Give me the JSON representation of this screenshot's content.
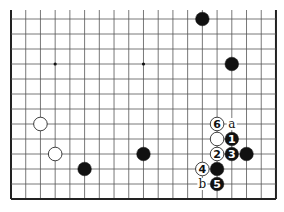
{
  "board": {
    "origin_x": 11,
    "origin_y": 19,
    "spacing_x": 14.72,
    "spacing_y": 15,
    "cols": 19,
    "rows": 13,
    "top_open_to_y": 10,
    "line_color": "#555555",
    "edge_color": "#222222",
    "star_points": [
      [
        3,
        3
      ],
      [
        9,
        3
      ]
    ]
  },
  "stones": [
    {
      "color": "black",
      "col": 13,
      "row": 0,
      "label": ""
    },
    {
      "color": "black",
      "col": 15,
      "row": 3,
      "label": ""
    },
    {
      "color": "white",
      "col": 2,
      "row": 7,
      "label": ""
    },
    {
      "color": "white",
      "col": 3,
      "row": 9,
      "label": ""
    },
    {
      "color": "black",
      "col": 5,
      "row": 10,
      "label": ""
    },
    {
      "color": "black",
      "col": 9,
      "row": 9,
      "label": ""
    },
    {
      "color": "white",
      "col": 14,
      "row": 7,
      "label": "6"
    },
    {
      "color": "white",
      "col": 14,
      "row": 8,
      "label": ""
    },
    {
      "color": "black",
      "col": 15,
      "row": 8,
      "label": "1"
    },
    {
      "color": "white",
      "col": 14,
      "row": 9,
      "label": "2"
    },
    {
      "color": "black",
      "col": 15,
      "row": 9,
      "label": "3"
    },
    {
      "color": "black",
      "col": 16,
      "row": 9,
      "label": ""
    },
    {
      "color": "white",
      "col": 13,
      "row": 10,
      "label": "4"
    },
    {
      "color": "black",
      "col": 14,
      "row": 10,
      "label": ""
    },
    {
      "color": "black",
      "col": 14,
      "row": 11,
      "label": "5"
    }
  ],
  "markers": [
    {
      "col": 15,
      "row": 7,
      "label": "a"
    },
    {
      "col": 13,
      "row": 11,
      "label": "b"
    }
  ]
}
